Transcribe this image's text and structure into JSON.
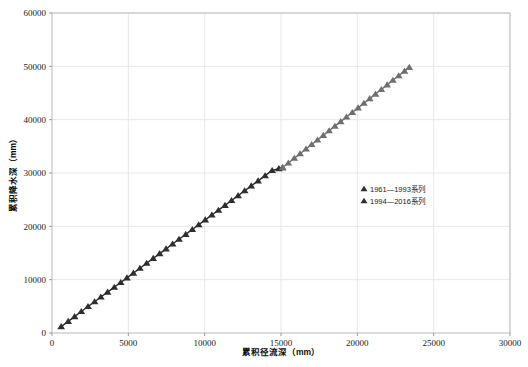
{
  "chart_data": {
    "type": "scatter",
    "title": "",
    "subtitle": "",
    "xlabel": "累积径流深（mm）",
    "ylabel": "累积降水深（mm）",
    "xlim": [
      0,
      30000
    ],
    "ylim": [
      0,
      60000
    ],
    "xticks": [
      0,
      5000,
      10000,
      15000,
      20000,
      25000,
      30000
    ],
    "yticks": [
      0,
      10000,
      20000,
      30000,
      40000,
      50000,
      60000
    ],
    "xtick_labels": [
      "0",
      "5000",
      "10000",
      "15000",
      "20000",
      "25000",
      "30000"
    ],
    "ytick_labels": [
      "0",
      "10000",
      "20000",
      "30000",
      "40000",
      "50000",
      "60000"
    ],
    "grid": true,
    "grid_color": "#e8e8e8",
    "legend_position": "center-right",
    "marker": "triangle-up",
    "series": [
      {
        "name": "1961—1993系列",
        "color": "#2e2e2e",
        "x": [
          600,
          1060,
          1480,
          1920,
          2360,
          2790,
          3200,
          3640,
          4080,
          4500,
          4910,
          5330,
          5760,
          6200,
          6630,
          7050,
          7470,
          7900,
          8320,
          8760,
          9190,
          9610,
          10040,
          10470,
          10900,
          11330,
          11760,
          12190,
          12620,
          13050,
          13500,
          13960,
          14420,
          14860,
          15100
        ],
        "y": [
          1200,
          2180,
          3080,
          4030,
          4960,
          5870,
          6740,
          7670,
          8590,
          9470,
          10340,
          11230,
          12140,
          13080,
          13990,
          14880,
          15770,
          16680,
          17570,
          18500,
          19410,
          20300,
          21210,
          22120,
          23030,
          23940,
          24850,
          25760,
          26670,
          27580,
          28530,
          29500,
          30470,
          30820,
          31020
        ]
      },
      {
        "name": "1994—2016系列",
        "color": "#6f6f6f",
        "x": [
          15100,
          15480,
          15870,
          16250,
          16640,
          17010,
          17390,
          17770,
          18150,
          18530,
          18910,
          19290,
          19670,
          20050,
          20430,
          20810,
          21190,
          21570,
          21950,
          22330,
          22710,
          23090,
          23400
        ],
        "y": [
          31020,
          31880,
          32760,
          33620,
          34490,
          35340,
          36200,
          37060,
          37920,
          38780,
          39640,
          40500,
          41360,
          42220,
          43080,
          43940,
          44800,
          45660,
          46520,
          47380,
          48240,
          49100,
          49800
        ]
      }
    ]
  },
  "legend": {
    "items": [
      {
        "label": "1961—1993系列",
        "marker": "▲",
        "color": "#2e2e2e"
      },
      {
        "label": "1994—2016系列",
        "marker": "▲",
        "color": "#2e2e2e"
      }
    ]
  }
}
